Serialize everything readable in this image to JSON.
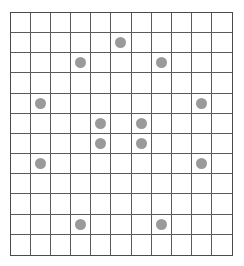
{
  "board": {
    "rows": 12,
    "cols": 11,
    "grid_line_color": "#5a5a5a",
    "border_color": "#4a4a4a",
    "dot_color": "#9a9a9a",
    "pieces": [
      {
        "row": 1,
        "col": 5
      },
      {
        "row": 2,
        "col": 3
      },
      {
        "row": 2,
        "col": 7
      },
      {
        "row": 4,
        "col": 1
      },
      {
        "row": 4,
        "col": 9
      },
      {
        "row": 5,
        "col": 4
      },
      {
        "row": 5,
        "col": 6
      },
      {
        "row": 6,
        "col": 4
      },
      {
        "row": 6,
        "col": 6
      },
      {
        "row": 7,
        "col": 1
      },
      {
        "row": 7,
        "col": 9
      },
      {
        "row": 10,
        "col": 3
      },
      {
        "row": 10,
        "col": 7
      }
    ]
  }
}
